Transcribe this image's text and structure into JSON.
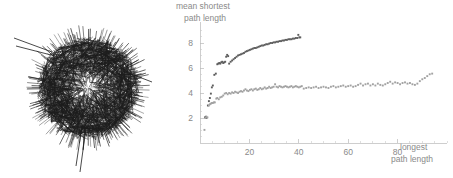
{
  "figure": {
    "background": "#ffffff",
    "panels": [
      "network-graph",
      "scatter-chart"
    ]
  },
  "network": {
    "name": "network-hairball",
    "description": "dense network graph rendered as a hairball with protruding edges",
    "node_color": "#1c1c1c",
    "edge_color": "#1c1c1c",
    "center_x": 88,
    "center_y": 88,
    "radius": 52,
    "edge_count": 1400,
    "spike_count": 180,
    "long_tendrils": [
      {
        "x1": 86,
        "y1": 128,
        "x2": 80,
        "y2": 172
      },
      {
        "x1": 82,
        "y1": 126,
        "x2": 76,
        "y2": 166
      },
      {
        "x1": 52,
        "y1": 52,
        "x2": 14,
        "y2": 38
      },
      {
        "x1": 55,
        "y1": 56,
        "x2": 16,
        "y2": 46
      },
      {
        "x1": 126,
        "y1": 72,
        "x2": 152,
        "y2": 82
      }
    ]
  },
  "chart_data": {
    "type": "scatter",
    "title": "",
    "xlabel": "longest path length",
    "ylabel": "mean shortest path length",
    "xlim": [
      0,
      100
    ],
    "ylim": [
      0,
      9.2
    ],
    "grid": false,
    "legend": "none",
    "xticks": [
      20,
      40,
      60,
      80
    ],
    "xtick_labels": [
      "20",
      "40",
      "60",
      "80"
    ],
    "xminor_step": 5,
    "yticks": [
      2,
      4,
      6,
      8
    ],
    "ytick_labels": [
      "2",
      "4",
      "6",
      "8"
    ],
    "yminor_step": 0.5,
    "series": [
      {
        "name": "upper-series",
        "color": "#5e5e5e",
        "marker": "square",
        "marker_size": 1.9,
        "points": [
          [
            2.0,
            2.05
          ],
          [
            2.4,
            2.1
          ],
          [
            2.6,
            2.0
          ],
          [
            3.2,
            3.0
          ],
          [
            3.6,
            3.35
          ],
          [
            4.0,
            3.6
          ],
          [
            4.4,
            3.95
          ],
          [
            4.8,
            4.45
          ],
          [
            5.2,
            4.6
          ],
          [
            5.8,
            5.45
          ],
          [
            6.4,
            5.55
          ],
          [
            7.0,
            6.3
          ],
          [
            7.4,
            6.35
          ],
          [
            7.8,
            6.4
          ],
          [
            8.2,
            6.35
          ],
          [
            8.6,
            6.45
          ],
          [
            9.0,
            6.5
          ],
          [
            9.4,
            6.4
          ],
          [
            9.8,
            6.45
          ],
          [
            10.2,
            6.5
          ],
          [
            10.6,
            6.9
          ],
          [
            11.0,
            7.05
          ],
          [
            11.4,
            6.95
          ],
          [
            11.8,
            6.35
          ],
          [
            12.4,
            6.5
          ],
          [
            13.0,
            6.6
          ],
          [
            13.6,
            6.7
          ],
          [
            14.2,
            6.8
          ],
          [
            14.8,
            6.9
          ],
          [
            15.4,
            7.0
          ],
          [
            16.0,
            7.05
          ],
          [
            16.6,
            7.1
          ],
          [
            17.2,
            7.15
          ],
          [
            17.8,
            7.2
          ],
          [
            18.4,
            7.3
          ],
          [
            19.0,
            7.35
          ],
          [
            19.6,
            7.4
          ],
          [
            20.2,
            7.45
          ],
          [
            20.8,
            7.5
          ],
          [
            21.4,
            7.55
          ],
          [
            22.0,
            7.6
          ],
          [
            22.6,
            7.6
          ],
          [
            23.2,
            7.65
          ],
          [
            23.8,
            7.7
          ],
          [
            24.4,
            7.75
          ],
          [
            25.0,
            7.8
          ],
          [
            25.6,
            7.8
          ],
          [
            26.2,
            7.85
          ],
          [
            26.8,
            7.9
          ],
          [
            27.4,
            7.9
          ],
          [
            28.0,
            7.95
          ],
          [
            28.6,
            8.0
          ],
          [
            29.2,
            8.0
          ],
          [
            29.8,
            8.05
          ],
          [
            30.4,
            8.05
          ],
          [
            31.0,
            8.1
          ],
          [
            31.6,
            8.1
          ],
          [
            32.2,
            8.15
          ],
          [
            32.8,
            8.15
          ],
          [
            33.4,
            8.2
          ],
          [
            34.0,
            8.2
          ],
          [
            34.6,
            8.25
          ],
          [
            35.2,
            8.25
          ],
          [
            35.8,
            8.3
          ],
          [
            36.4,
            8.3
          ],
          [
            37.0,
            8.3
          ],
          [
            37.6,
            8.35
          ],
          [
            38.2,
            8.35
          ],
          [
            38.8,
            8.4
          ],
          [
            39.4,
            8.4
          ],
          [
            39.8,
            8.65
          ],
          [
            40.2,
            8.45
          ],
          [
            40.6,
            8.45
          ]
        ]
      },
      {
        "name": "lower-series",
        "color": "#a2a2a2",
        "marker": "square",
        "marker_size": 1.9,
        "points": [
          [
            1.8,
            1.05
          ],
          [
            2.2,
            2.0
          ],
          [
            2.6,
            2.1
          ],
          [
            3.0,
            2.05
          ],
          [
            3.6,
            3.0
          ],
          [
            4.0,
            3.1
          ],
          [
            4.4,
            3.15
          ],
          [
            4.8,
            3.2
          ],
          [
            5.2,
            3.2
          ],
          [
            5.6,
            3.25
          ],
          [
            6.0,
            3.25
          ],
          [
            6.6,
            3.55
          ],
          [
            7.0,
            3.6
          ],
          [
            7.6,
            3.5
          ],
          [
            8.2,
            3.65
          ],
          [
            8.8,
            3.7
          ],
          [
            9.4,
            3.8
          ],
          [
            10.0,
            3.95
          ],
          [
            10.6,
            4.0
          ],
          [
            11.2,
            3.9
          ],
          [
            11.8,
            4.0
          ],
          [
            12.4,
            3.95
          ],
          [
            13.0,
            4.05
          ],
          [
            13.6,
            4.0
          ],
          [
            14.2,
            4.1
          ],
          [
            14.8,
            4.05
          ],
          [
            15.4,
            4.0
          ],
          [
            16.0,
            4.1
          ],
          [
            16.6,
            4.15
          ],
          [
            17.2,
            4.1
          ],
          [
            17.8,
            4.2
          ],
          [
            18.4,
            4.3
          ],
          [
            19.0,
            4.2
          ],
          [
            19.6,
            4.15
          ],
          [
            20.2,
            4.25
          ],
          [
            20.8,
            4.3
          ],
          [
            21.4,
            4.2
          ],
          [
            22.0,
            4.3
          ],
          [
            22.6,
            4.35
          ],
          [
            23.2,
            4.25
          ],
          [
            23.8,
            4.3
          ],
          [
            24.4,
            4.4
          ],
          [
            25.0,
            4.3
          ],
          [
            25.6,
            4.35
          ],
          [
            26.2,
            4.45
          ],
          [
            26.8,
            4.35
          ],
          [
            27.4,
            4.4
          ],
          [
            28.0,
            4.5
          ],
          [
            28.6,
            4.4
          ],
          [
            29.2,
            4.45
          ],
          [
            29.8,
            4.5
          ],
          [
            30.4,
            4.7
          ],
          [
            31.0,
            4.5
          ],
          [
            31.6,
            4.45
          ],
          [
            32.2,
            4.55
          ],
          [
            32.8,
            4.5
          ],
          [
            33.4,
            4.45
          ],
          [
            34.0,
            4.5
          ],
          [
            34.6,
            4.55
          ],
          [
            35.2,
            4.5
          ],
          [
            35.8,
            4.45
          ],
          [
            36.4,
            4.5
          ],
          [
            37.0,
            4.55
          ],
          [
            37.6,
            4.45
          ],
          [
            38.2,
            4.5
          ],
          [
            38.8,
            4.55
          ],
          [
            39.4,
            4.5
          ],
          [
            40.0,
            4.45
          ],
          [
            40.6,
            4.5
          ],
          [
            41.2,
            4.55
          ],
          [
            42.0,
            4.35
          ],
          [
            43.0,
            4.4
          ],
          [
            44.0,
            4.45
          ],
          [
            45.0,
            4.4
          ],
          [
            46.0,
            4.45
          ],
          [
            47.0,
            4.5
          ],
          [
            48.0,
            4.4
          ],
          [
            49.0,
            4.45
          ],
          [
            50.0,
            4.5
          ],
          [
            51.0,
            4.45
          ],
          [
            52.0,
            4.4
          ],
          [
            53.0,
            4.5
          ],
          [
            54.0,
            4.55
          ],
          [
            55.0,
            4.45
          ],
          [
            56.0,
            4.5
          ],
          [
            57.0,
            4.55
          ],
          [
            58.0,
            4.6
          ],
          [
            59.0,
            4.5
          ],
          [
            60.0,
            4.55
          ],
          [
            61.0,
            4.6
          ],
          [
            62.0,
            4.5
          ],
          [
            63.0,
            4.55
          ],
          [
            64.0,
            4.65
          ],
          [
            65.0,
            4.75
          ],
          [
            66.0,
            4.6
          ],
          [
            67.0,
            4.7
          ],
          [
            68.0,
            4.75
          ],
          [
            69.0,
            4.6
          ],
          [
            70.0,
            4.7
          ],
          [
            71.0,
            4.6
          ],
          [
            72.0,
            4.75
          ],
          [
            73.0,
            4.65
          ],
          [
            74.0,
            4.6
          ],
          [
            75.0,
            4.7
          ],
          [
            76.0,
            4.8
          ],
          [
            77.0,
            4.9
          ],
          [
            78.0,
            4.75
          ],
          [
            79.0,
            4.85
          ],
          [
            80.0,
            4.8
          ],
          [
            81.0,
            4.7
          ],
          [
            82.0,
            4.8
          ],
          [
            83.0,
            4.85
          ],
          [
            84.0,
            4.75
          ],
          [
            85.0,
            4.8
          ],
          [
            86.0,
            4.7
          ],
          [
            87.0,
            4.65
          ],
          [
            88.0,
            4.75
          ],
          [
            89.0,
            4.95
          ],
          [
            90.0,
            5.1
          ],
          [
            91.0,
            5.2
          ],
          [
            92.0,
            5.35
          ],
          [
            93.0,
            5.5
          ],
          [
            94.0,
            5.55
          ]
        ]
      }
    ]
  }
}
